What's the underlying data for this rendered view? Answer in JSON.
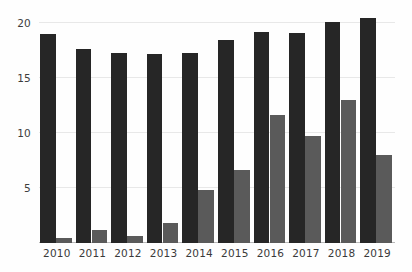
{
  "chart_data": {
    "type": "bar",
    "title": "",
    "subtitle": "",
    "xlabel": "",
    "ylabel": "",
    "categories": [
      "2010",
      "2011",
      "2012",
      "2013",
      "2014",
      "2015",
      "2016",
      "2017",
      "2018",
      "2019"
    ],
    "series": [
      {
        "name": "Series 1",
        "color": "#262626",
        "values": [
          19.0,
          17.6,
          17.3,
          17.2,
          17.3,
          18.5,
          19.2,
          19.1,
          20.1,
          20.5
        ]
      },
      {
        "name": "Series 2",
        "color": "#5a5a5a",
        "values": [
          0.5,
          1.2,
          0.6,
          1.8,
          4.8,
          6.6,
          11.6,
          9.7,
          13.0,
          8.0
        ]
      }
    ],
    "ylim": [
      0,
      21.0
    ],
    "yticks": [
      5,
      10,
      15,
      20
    ],
    "ytick_labels": [
      "5",
      "10",
      "15",
      "20"
    ],
    "grid": true,
    "grid_color": "#e8e8e8",
    "axis_color": "#b9b9b9",
    "legend": false,
    "legend_position": "none",
    "background": "#fefefe",
    "annotations": []
  }
}
